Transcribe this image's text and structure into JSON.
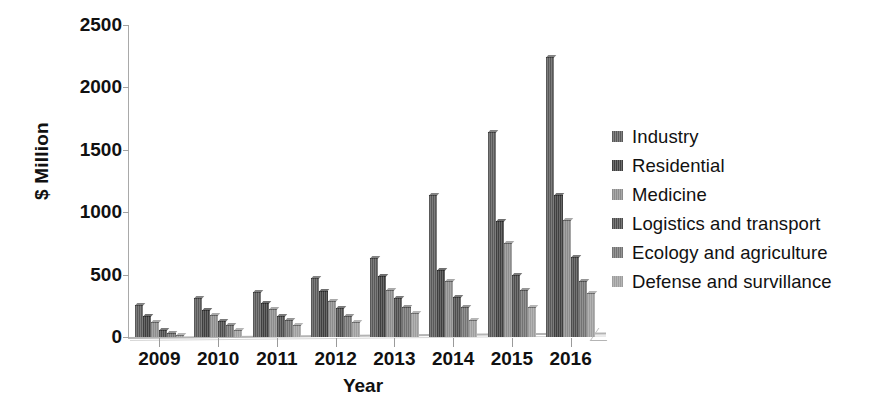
{
  "chart_data": {
    "type": "bar",
    "title": "",
    "subtitle": "",
    "xlabel": "Year",
    "ylabel": "$ Million",
    "categories": [
      "2009",
      "2010",
      "2011",
      "2012",
      "2013",
      "2014",
      "2015",
      "2016"
    ],
    "ylim": [
      0,
      2500
    ],
    "yticks": [
      0,
      500,
      1000,
      1500,
      2000,
      2500
    ],
    "ytick_labels": [
      "0",
      "500",
      "1000",
      "1500",
      "2000",
      "2500"
    ],
    "grid": false,
    "legend_position": "right",
    "series": [
      {
        "name": "Industry",
        "color": "#595959",
        "values": [
          260,
          310,
          360,
          470,
          630,
          1140,
          1640,
          2240
        ]
      },
      {
        "name": "Residential",
        "color": "#3f3f3f",
        "values": [
          170,
          220,
          270,
          370,
          490,
          540,
          930,
          1140
        ]
      },
      {
        "name": "Medicine",
        "color": "#8c8c8c",
        "values": [
          120,
          180,
          225,
          290,
          380,
          450,
          750,
          940
        ]
      },
      {
        "name": "Logistics and transport",
        "color": "#4d4d4d",
        "values": [
          60,
          130,
          170,
          230,
          310,
          320,
          500,
          640
        ]
      },
      {
        "name": "Ecology and agriculture",
        "color": "#737373",
        "values": [
          35,
          95,
          135,
          170,
          240,
          240,
          375,
          450
        ]
      },
      {
        "name": "Defense and survillance",
        "color": "#9e9e9e",
        "values": [
          20,
          60,
          100,
          120,
          190,
          140,
          240,
          350
        ]
      }
    ]
  },
  "legend": {
    "items": [
      {
        "label": "Industry",
        "color": "#595959"
      },
      {
        "label": "Residential",
        "color": "#3f3f3f"
      },
      {
        "label": "Medicine",
        "color": "#8c8c8c"
      },
      {
        "label": "Logistics and transport",
        "color": "#4d4d4d"
      },
      {
        "label": "Ecology and agriculture",
        "color": "#737373"
      },
      {
        "label": "Defense and survillance",
        "color": "#9e9e9e"
      }
    ]
  }
}
